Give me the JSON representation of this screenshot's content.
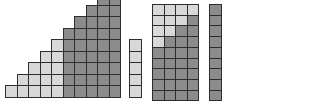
{
  "diagram": {
    "colors": {
      "light": "#d8d8d8",
      "dark": "#8c8c8c",
      "border": "#2e2e2e"
    },
    "cell_size": 11.5,
    "staircase": {
      "origin_x": 5,
      "base_y": 96.5,
      "columns": 10,
      "heights": [
        1,
        2,
        3,
        4,
        5,
        6,
        7,
        8,
        9,
        10
      ],
      "light_counts": [
        1,
        2,
        3,
        4,
        5,
        0,
        0,
        0,
        0,
        0
      ]
    },
    "light_column": {
      "x": 129,
      "top_y": 39,
      "rows": 5,
      "light_count": 5
    },
    "grid": {
      "x": 152,
      "top_y": 4,
      "cols": 4,
      "rows": 10,
      "light_per_row": [
        4,
        3,
        2,
        1,
        0,
        0,
        0,
        0,
        0,
        0
      ]
    },
    "dark_column": {
      "x": 209,
      "top_y": 4,
      "rows": 10,
      "light_count": 0
    }
  }
}
